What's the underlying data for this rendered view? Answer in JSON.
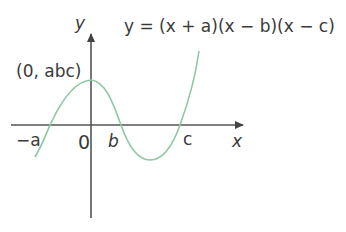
{
  "figure": {
    "equation": "y = (x + a)(x − b)(x − c)",
    "y_axis_label": "y",
    "x_axis_label": "x",
    "intercept_label": "(0, abc)",
    "x_ticks": [
      "−a",
      "0",
      "b",
      "c"
    ]
  },
  "colors": {
    "curve": "#8cc8a4",
    "axis": "#555555",
    "text": "#3a3a3a"
  }
}
